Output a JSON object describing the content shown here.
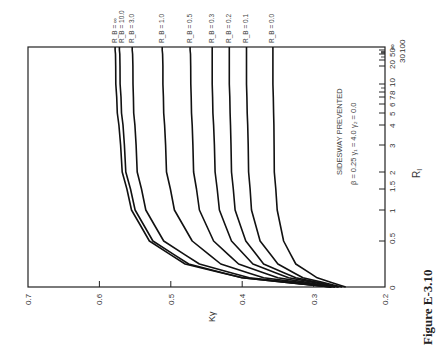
{
  "figure": {
    "caption": "Figure E-3.10",
    "annotation_line1": "SIDESWAY PREVENTED",
    "annotation_line2": "β = 0.25   γ₁ = 4.0   γ₂ = 0.0",
    "orientation": "rotated 90° counter-clockwise on page"
  },
  "chart_data": {
    "type": "line",
    "title": "",
    "xlabel": "R_I",
    "ylabel": "Kγ",
    "x_scale": "nonlinear (compressed, extends to ∞)",
    "x_ticks": [
      "0",
      "0.5",
      "1",
      "1.5",
      "2",
      "3",
      "4",
      "5",
      "6",
      "7",
      "8",
      "10",
      "20",
      "30",
      "50",
      "100",
      "∞"
    ],
    "y_ticks": [
      "0.2",
      "0.3",
      "0.4",
      "0.5",
      "0.6",
      "0.7"
    ],
    "ylim": [
      0.2,
      0.7
    ],
    "grid": false,
    "legend_position": "labels at curve ends (top of rotated page)",
    "x": [
      0,
      0.1,
      0.25,
      0.5,
      1,
      2,
      5,
      10,
      100,
      "∞"
    ],
    "series": [
      {
        "name": "R_B = ∞",
        "values": [
          0.275,
          0.4,
          0.48,
          0.53,
          0.555,
          0.568,
          0.575,
          0.577,
          0.578,
          0.578
        ]
      },
      {
        "name": "R_B = 10.0",
        "values": [
          0.275,
          0.4,
          0.475,
          0.525,
          0.55,
          0.563,
          0.569,
          0.571,
          0.572,
          0.572
        ]
      },
      {
        "name": "R_B = 3.0",
        "values": [
          0.275,
          0.39,
          0.46,
          0.51,
          0.535,
          0.547,
          0.552,
          0.553,
          0.554,
          0.554
        ]
      },
      {
        "name": "R_B = 1.0",
        "values": [
          0.27,
          0.37,
          0.43,
          0.47,
          0.495,
          0.506,
          0.51,
          0.511,
          0.512,
          0.512
        ]
      },
      {
        "name": "R_B = 0.5",
        "values": [
          0.27,
          0.35,
          0.405,
          0.44,
          0.46,
          0.468,
          0.471,
          0.472,
          0.473,
          0.473
        ]
      },
      {
        "name": "R_B = 0.3",
        "values": [
          0.265,
          0.335,
          0.385,
          0.415,
          0.432,
          0.438,
          0.441,
          0.442,
          0.442,
          0.442
        ]
      },
      {
        "name": "R_B = 0.2",
        "values": [
          0.265,
          0.325,
          0.37,
          0.395,
          0.41,
          0.415,
          0.417,
          0.418,
          0.418,
          0.418
        ]
      },
      {
        "name": "R_B = 0.1",
        "values": [
          0.26,
          0.315,
          0.35,
          0.375,
          0.387,
          0.391,
          0.393,
          0.394,
          0.394,
          0.394
        ]
      },
      {
        "name": "R_B = 0.0",
        "values": [
          0.255,
          0.295,
          0.325,
          0.342,
          0.351,
          0.355,
          0.356,
          0.357,
          0.357,
          0.357
        ]
      }
    ],
    "annotations": [
      "SIDESWAY PREVENTED",
      "β = 0.25  γ₁ = 4.0  γ₂ = 0.0"
    ]
  },
  "axis_labels": {
    "ky": "Kγ",
    "ri": "R",
    "ri_sub": "I"
  },
  "curve_labels": [
    "R_B = ∞",
    "R_B = 10.0",
    "R_B = 3.0",
    "R_B = 1.0",
    "R_B = 0.5",
    "R_B = 0.3",
    "R_B = 0.2",
    "R_B = 0.1",
    "R_B = 0.0"
  ]
}
